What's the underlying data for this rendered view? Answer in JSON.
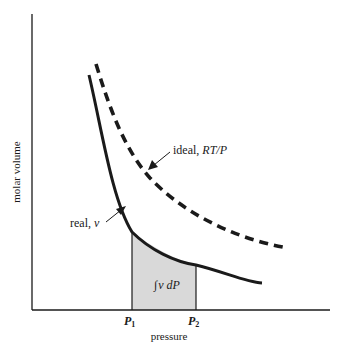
{
  "diagram": {
    "x_axis_label": "pressure",
    "y_axis_label": "molar volume",
    "curves": {
      "ideal": {
        "label_prefix": "ideal, ",
        "label_math": "RT/P",
        "style": "dashed"
      },
      "real": {
        "label_prefix": "real, ",
        "label_math": "v",
        "style": "solid"
      }
    },
    "markers": {
      "p1": {
        "base": "P",
        "sub": "1"
      },
      "p2": {
        "base": "P",
        "sub": "2"
      }
    },
    "shaded_region": {
      "integral_symbol": "∫",
      "label": "v dP",
      "fill": "#d9d9d9"
    },
    "colors": {
      "ink": "#1a1a1a",
      "shade": "#d9d9d9",
      "background": "#ffffff"
    }
  }
}
